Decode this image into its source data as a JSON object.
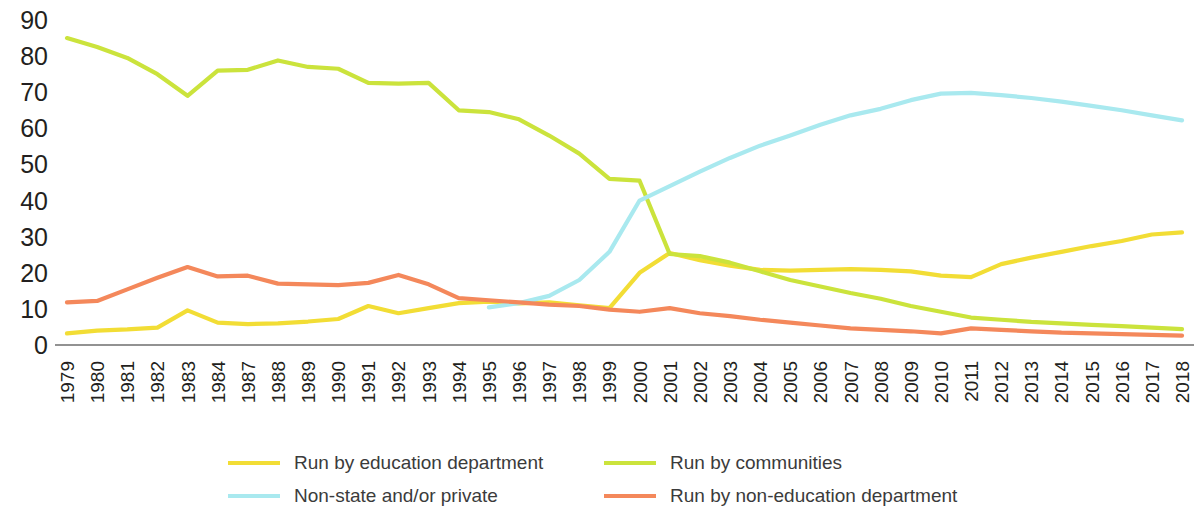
{
  "chart_data": {
    "type": "line",
    "title": "",
    "subtitle": "",
    "xlabel": "",
    "ylabel": "",
    "ylim": [
      0,
      90
    ],
    "yticks": [
      0,
      10,
      20,
      30,
      40,
      50,
      60,
      70,
      80,
      90
    ],
    "grid": false,
    "legend_position": "bottom",
    "categories": [
      "1979",
      "1980",
      "1981",
      "1982",
      "1983",
      "1984",
      "1987",
      "1988",
      "1989",
      "1990",
      "1991",
      "1992",
      "1993",
      "1994",
      "1995",
      "1996",
      "1997",
      "1998",
      "1999",
      "2000",
      "2001",
      "2002",
      "2003",
      "2004",
      "2005",
      "2006",
      "2007",
      "2008",
      "2009",
      "2010",
      "2011",
      "2012",
      "2013",
      "2014",
      "2015",
      "2016",
      "2017",
      "2018"
    ],
    "series": [
      {
        "name": "Run by education department",
        "color": "#f2dd35",
        "values": [
          3.2,
          4.0,
          4.3,
          4.8,
          9.6,
          6.2,
          5.8,
          6.0,
          6.5,
          7.2,
          10.8,
          8.8,
          10.2,
          11.6,
          12.0,
          11.5,
          11.8,
          11.0,
          10.2,
          20.0,
          25.5,
          23.5,
          22.0,
          20.8,
          20.6,
          20.8,
          21.0,
          20.8,
          20.4,
          19.2,
          18.8,
          22.4,
          24.2,
          25.8,
          27.4,
          28.8,
          30.6,
          31.2
        ]
      },
      {
        "name": "Run by communities",
        "color": "#cbe33c",
        "values": [
          85.0,
          82.5,
          79.5,
          75.0,
          69.0,
          76.0,
          76.2,
          78.8,
          77.0,
          76.5,
          72.6,
          72.4,
          72.6,
          65.0,
          64.5,
          62.5,
          58.0,
          53.0,
          46.0,
          45.5,
          25.2,
          24.6,
          22.8,
          20.4,
          18.0,
          16.2,
          14.4,
          12.8,
          10.8,
          9.2,
          7.6,
          7.0,
          6.4,
          6.0,
          5.6,
          5.2,
          4.8,
          4.4
        ]
      },
      {
        "name": "Non-state and/or private",
        "color": "#a9e9ef",
        "values": [
          null,
          null,
          null,
          null,
          null,
          null,
          null,
          null,
          null,
          null,
          null,
          null,
          null,
          null,
          10.4,
          11.6,
          13.6,
          18.0,
          25.8,
          40.0,
          44.0,
          48.0,
          51.8,
          55.2,
          58.0,
          61.0,
          63.6,
          65.4,
          67.8,
          69.6,
          69.8,
          69.2,
          68.4,
          67.4,
          66.2,
          65.0,
          63.6,
          62.2
        ]
      },
      {
        "name": "Run by non-education department",
        "color": "#f4885b",
        "values": [
          11.8,
          12.2,
          15.4,
          18.6,
          21.6,
          19.0,
          19.2,
          17.0,
          16.8,
          16.6,
          17.2,
          19.4,
          16.8,
          13.0,
          12.4,
          11.8,
          11.2,
          10.8,
          9.8,
          9.2,
          10.2,
          8.8,
          8.0,
          7.0,
          6.2,
          5.4,
          4.6,
          4.2,
          3.8,
          3.2,
          4.6,
          4.2,
          3.8,
          3.4,
          3.2,
          3.0,
          2.8,
          2.6
        ]
      }
    ]
  },
  "legend": {
    "items": [
      {
        "label": "Run by education department",
        "color": "#f2dd35"
      },
      {
        "label": "Run by communities",
        "color": "#cbe33c"
      },
      {
        "label": "Non-state and/or private",
        "color": "#a9e9ef"
      },
      {
        "label": "Run by non-education department",
        "color": "#f4885b"
      }
    ]
  }
}
